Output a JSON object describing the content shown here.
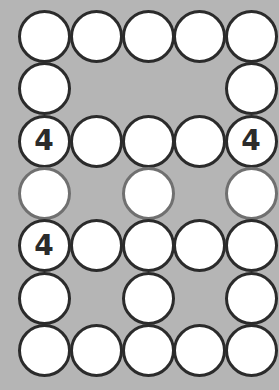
{
  "puzzle": {
    "colors": {
      "background": "#b5b5b5",
      "cell_fill": "#ffffff",
      "cell_border": "#2b2b2b",
      "cell_border_muted": "#707070"
    },
    "columns": 5,
    "rows": 7,
    "cells": [
      {
        "row": 1,
        "col": 1,
        "value": ""
      },
      {
        "row": 1,
        "col": 2,
        "value": ""
      },
      {
        "row": 1,
        "col": 3,
        "value": ""
      },
      {
        "row": 1,
        "col": 4,
        "value": ""
      },
      {
        "row": 1,
        "col": 5,
        "value": ""
      },
      {
        "row": 2,
        "col": 1,
        "value": ""
      },
      {
        "row": 2,
        "col": 5,
        "value": ""
      },
      {
        "row": 3,
        "col": 1,
        "value": "4"
      },
      {
        "row": 3,
        "col": 2,
        "value": ""
      },
      {
        "row": 3,
        "col": 3,
        "value": ""
      },
      {
        "row": 3,
        "col": 4,
        "value": ""
      },
      {
        "row": 3,
        "col": 5,
        "value": "4"
      },
      {
        "row": 4,
        "col": 1,
        "value": "",
        "muted": true
      },
      {
        "row": 4,
        "col": 3,
        "value": "",
        "muted": true
      },
      {
        "row": 4,
        "col": 5,
        "value": "",
        "muted": true
      },
      {
        "row": 5,
        "col": 1,
        "value": "4"
      },
      {
        "row": 5,
        "col": 2,
        "value": ""
      },
      {
        "row": 5,
        "col": 3,
        "value": ""
      },
      {
        "row": 5,
        "col": 4,
        "value": ""
      },
      {
        "row": 5,
        "col": 5,
        "value": ""
      },
      {
        "row": 6,
        "col": 1,
        "value": ""
      },
      {
        "row": 6,
        "col": 3,
        "value": ""
      },
      {
        "row": 6,
        "col": 5,
        "value": ""
      },
      {
        "row": 7,
        "col": 1,
        "value": ""
      },
      {
        "row": 7,
        "col": 2,
        "value": ""
      },
      {
        "row": 7,
        "col": 3,
        "value": ""
      },
      {
        "row": 7,
        "col": 4,
        "value": ""
      },
      {
        "row": 7,
        "col": 5,
        "value": ""
      }
    ]
  }
}
